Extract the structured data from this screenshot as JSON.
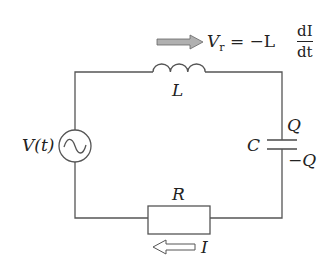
{
  "diagram": {
    "type": "RLC series circuit",
    "colors": {
      "wire": "#555555",
      "arrow_fill": "#b0b0b0",
      "text": "#222222"
    },
    "components": {
      "source": {
        "label": "V(t)",
        "symbol": "ac-source"
      },
      "inductor": {
        "label": "L"
      },
      "capacitor": {
        "label": "C",
        "top_charge": "Q",
        "bottom_charge": "−Q"
      },
      "resistor": {
        "label": "R"
      }
    },
    "annotations": {
      "voltage_arrow": {
        "lhs": "V",
        "lhs_sub": "r",
        "eq": "= −L",
        "num": "dI",
        "den": "dt"
      },
      "current_arrow": {
        "label": "I"
      }
    }
  }
}
